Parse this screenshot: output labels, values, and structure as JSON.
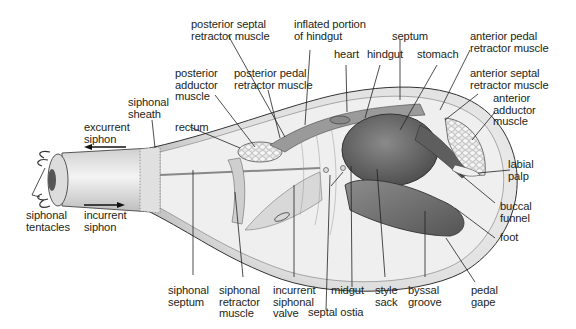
{
  "diagram": {
    "colors": {
      "ink": "#231f20",
      "body_light": "#e8e8e8",
      "body_mid": "#b9b9b9",
      "organ_dark": "#6e6e6e",
      "organ_darker": "#4f4f4f",
      "background": "#ffffff"
    },
    "labels": {
      "posterior_septal_retractor_muscle": "posterior septal\nretractor muscle",
      "inflated_portion_of_hindgut": "inflated portion\nof hindgut",
      "septum": "septum",
      "anterior_pedal_retractor_muscle": "anterior pedal\nretractor muscle",
      "heart": "heart",
      "hindgut": "hindgut",
      "stomach": "stomach",
      "anterior_septal_retractor_muscle": "anterior septal\nretractor muscle",
      "posterior_adductor_muscle": "posterior\nadductor\nmuscle",
      "posterior_pedal_retractor_muscle": "posterior pedal\nretractor muscle",
      "anterior_adductor_muscle": "anterior\nadductor\nmuscle",
      "siphonal_sheath": "siphonal\nsheath",
      "excurrent_siphon": "excurrent\nsiphon",
      "rectum": "rectum",
      "labial_palp": "labial\npalp",
      "siphonal_tentacles": "siphonal\ntentacles",
      "incurrent_siphon": "incurrent\nsiphon",
      "buccal_funnel": "buccal\nfunnel",
      "foot": "foot",
      "siphonal_septum": "siphonal\nseptum",
      "siphonal_retractor_muscle": "siphonal\nretractor\nmuscle",
      "incurrent_siphonal_valve": "incurrent\nsiphonal\nvalve",
      "midgut": "midgut",
      "style_sack": "style\nsack",
      "byssal_groove": "byssal\ngroove",
      "pedal_gape": "pedal\ngape",
      "septal_ostia": "septal ostia"
    },
    "flow_arrows": [
      {
        "name": "excurrent",
        "direction": "left"
      },
      {
        "name": "incurrent",
        "direction": "right"
      }
    ]
  }
}
